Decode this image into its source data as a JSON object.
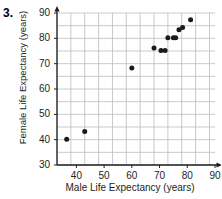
{
  "problem": {
    "number": "3."
  },
  "chart_data": {
    "type": "scatter",
    "title": "",
    "xlabel": "Male Life Expectancy (years)",
    "ylabel": "Female Life Expectancy (years)",
    "xlim": [
      33,
      90
    ],
    "ylim": [
      30,
      90
    ],
    "xticks": [
      40,
      50,
      60,
      70,
      80,
      90
    ],
    "yticks": [
      30,
      40,
      50,
      60,
      70,
      80,
      90
    ],
    "xtick_labels": [
      "40",
      "50",
      "60",
      "70",
      "80",
      "90"
    ],
    "ytick_labels": [
      "30",
      "40",
      "50",
      "60",
      "70",
      "80",
      "90"
    ],
    "grid": true,
    "grid_step_x": 5,
    "grid_step_y": 5,
    "legend": null,
    "marker": "filled-circle",
    "marker_color": "#1a1a1a",
    "points": [
      {
        "x": 36.5,
        "y": 40.2
      },
      {
        "x": 43.0,
        "y": 43.2
      },
      {
        "x": 60.0,
        "y": 68.3
      },
      {
        "x": 68.0,
        "y": 76.2
      },
      {
        "x": 70.5,
        "y": 75.2
      },
      {
        "x": 72.0,
        "y": 75.2
      },
      {
        "x": 73.0,
        "y": 80.2
      },
      {
        "x": 75.0,
        "y": 80.2
      },
      {
        "x": 75.8,
        "y": 80.2
      },
      {
        "x": 77.0,
        "y": 83.4
      },
      {
        "x": 78.3,
        "y": 84.3
      },
      {
        "x": 81.2,
        "y": 87.3
      }
    ]
  },
  "axes": {
    "x_arrow": "arrow-right",
    "y_arrow": "arrow-up"
  }
}
